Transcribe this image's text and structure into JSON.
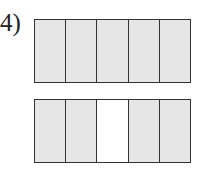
{
  "problem": {
    "label": "4)",
    "shade_color": "#e6e6e6",
    "empty_color": "#ffffff",
    "line_color": "#333333",
    "bars": [
      {
        "name": "top-bar",
        "parts": 5,
        "shaded": [
          true,
          true,
          true,
          true,
          true
        ]
      },
      {
        "name": "bottom-bar",
        "parts": 5,
        "shaded": [
          true,
          true,
          false,
          true,
          true
        ]
      }
    ]
  }
}
